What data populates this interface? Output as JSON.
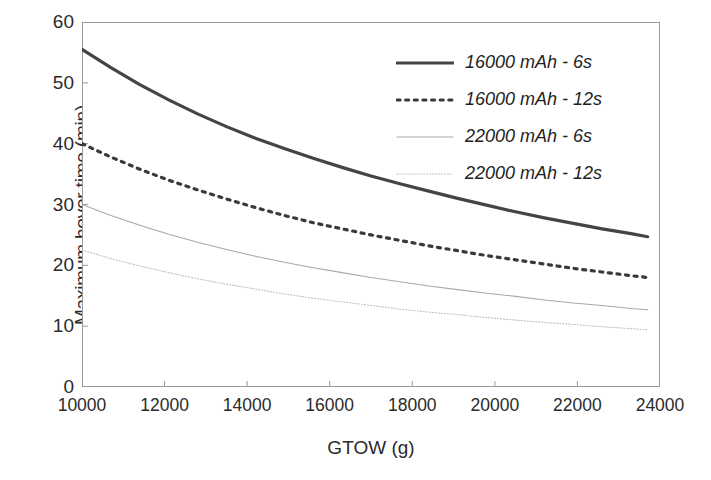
{
  "chart_data": {
    "type": "line",
    "title": "",
    "xlabel": "GTOW (g)",
    "ylabel": "Maximum hover time (min)",
    "xlim": [
      10000,
      24000
    ],
    "ylim": [
      0,
      60
    ],
    "xticks": [
      10000,
      12000,
      14000,
      16000,
      18000,
      20000,
      22000,
      24000
    ],
    "yticks": [
      0,
      10,
      20,
      30,
      40,
      50,
      60
    ],
    "xtick_labels": [
      "10000",
      "12000",
      "14000",
      "16000",
      "18000",
      "20000",
      "22000",
      "24000"
    ],
    "ytick_labels": [
      "0",
      "10",
      "20",
      "30",
      "40",
      "50",
      "60"
    ],
    "grid": false,
    "legend_position": "top-right",
    "x": [
      10000,
      10700,
      11400,
      12100,
      12800,
      13500,
      14200,
      14900,
      15600,
      16300,
      17000,
      17700,
      18400,
      19100,
      19800,
      20500,
      21200,
      21900,
      22600,
      23300,
      23700
    ],
    "series": [
      {
        "name": "16000 mAh - 6s",
        "style": "solid",
        "width": 3.2,
        "color": "#444444",
        "values": [
          55.5,
          52.5,
          49.7,
          47.2,
          44.9,
          42.8,
          40.9,
          39.2,
          37.6,
          36.1,
          34.7,
          33.4,
          32.2,
          31.0,
          29.9,
          28.8,
          27.8,
          26.9,
          26.0,
          25.2,
          24.7
        ]
      },
      {
        "name": "16000 mAh - 12s",
        "style": "dotted",
        "width": 3.2,
        "color": "#3a3a3a",
        "values": [
          40.0,
          37.8,
          35.8,
          34.0,
          32.4,
          30.9,
          29.5,
          28.2,
          27.0,
          26.0,
          25.0,
          24.1,
          23.2,
          22.4,
          21.6,
          20.9,
          20.2,
          19.5,
          18.9,
          18.3,
          18.0
        ]
      },
      {
        "name": "22000 mAh - 6s",
        "style": "solid",
        "width": 1.1,
        "color": "#a8a8a8",
        "values": [
          30.0,
          28.2,
          26.6,
          25.1,
          23.8,
          22.6,
          21.5,
          20.5,
          19.6,
          18.8,
          18.0,
          17.3,
          16.6,
          16.0,
          15.4,
          14.9,
          14.3,
          13.8,
          13.4,
          12.9,
          12.7
        ]
      },
      {
        "name": "22000 mAh - 12s",
        "style": "dotted",
        "width": 1.1,
        "color": "#bdbdbd",
        "values": [
          22.5,
          21.1,
          19.9,
          18.8,
          17.8,
          16.9,
          16.1,
          15.3,
          14.6,
          14.0,
          13.4,
          12.8,
          12.3,
          11.9,
          11.4,
          11.0,
          10.6,
          10.3,
          9.9,
          9.6,
          9.4
        ]
      }
    ]
  },
  "legend": {
    "items": [
      {
        "label": "16000 mAh - 6s"
      },
      {
        "label": "16000 mAh - 12s"
      },
      {
        "label": "22000 mAh - 6s"
      },
      {
        "label": "22000 mAh - 12s"
      }
    ]
  }
}
